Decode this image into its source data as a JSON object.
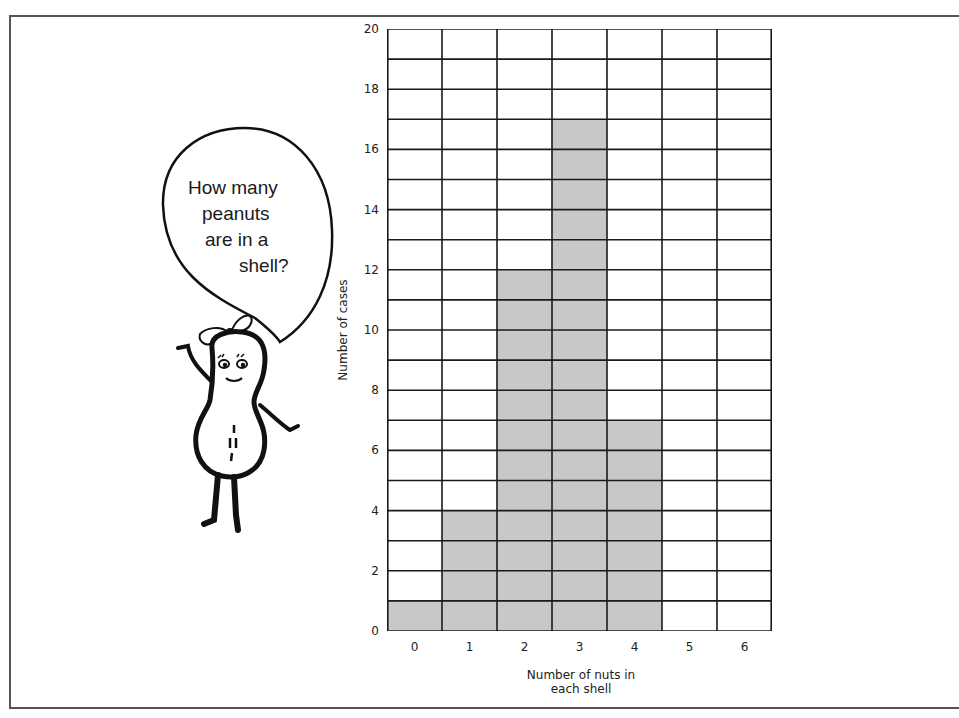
{
  "illustration": {
    "speech_bubble_lines": [
      "How many",
      "peanuts",
      "are in a",
      "shell?"
    ],
    "character": "peanut-mascot"
  },
  "chart_data": {
    "type": "bar",
    "title": "",
    "categories": [
      "0",
      "1",
      "2",
      "3",
      "4",
      "5",
      "6"
    ],
    "values": [
      1,
      4,
      12,
      17,
      7,
      0,
      0
    ],
    "xlabel": "Number of nuts in each shell",
    "xlabel_lines": [
      "Number of nuts in",
      "each shell"
    ],
    "ylabel": "Number of cases",
    "ylim": [
      0,
      20
    ],
    "yticks": [
      0,
      2,
      4,
      6,
      8,
      10,
      12,
      14,
      16,
      18,
      20
    ],
    "grid": true,
    "grid_minor_step": 1,
    "bar_color": "#c8c8c8",
    "grid_color": "#1a1a1a",
    "legend": null
  }
}
